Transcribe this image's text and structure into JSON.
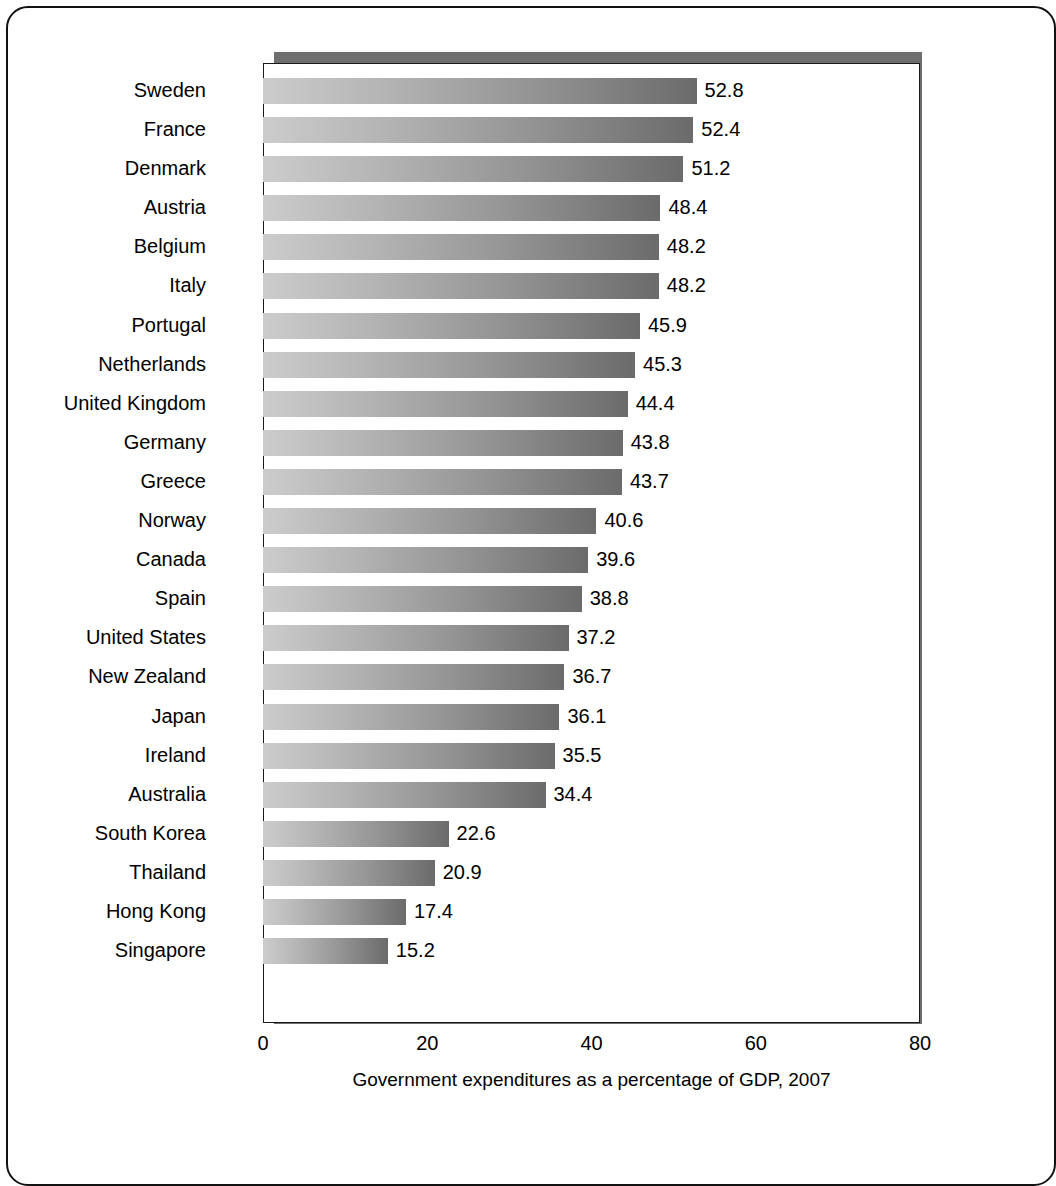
{
  "chart_data": {
    "type": "bar",
    "orientation": "horizontal",
    "title": "",
    "subtitle": "",
    "xlabel": "Government expenditures as a percentage of GDP, 2007",
    "ylabel": "",
    "xlim": [
      0,
      80
    ],
    "xticks": [
      "0",
      "20",
      "40",
      "60",
      "80"
    ],
    "grid": false,
    "legend": null,
    "categories": [
      "Sweden",
      "France",
      "Denmark",
      "Austria",
      "Belgium",
      "Italy",
      "Portugal",
      "Netherlands",
      "United Kingdom",
      "Germany",
      "Greece",
      "Norway",
      "Canada",
      "Spain",
      "United States",
      "New Zealand",
      "Japan",
      "Ireland",
      "Australia",
      "South Korea",
      "Thailand",
      "Hong Kong",
      "Singapore"
    ],
    "values": [
      52.8,
      52.4,
      51.2,
      48.4,
      48.2,
      48.2,
      45.9,
      45.3,
      44.4,
      43.8,
      43.7,
      40.6,
      39.6,
      38.8,
      37.2,
      36.7,
      36.1,
      35.5,
      34.4,
      22.6,
      20.9,
      17.4,
      15.2
    ],
    "value_labels": [
      "52.8",
      "52.4",
      "51.2",
      "48.4",
      "48.2",
      "48.2",
      "45.9",
      "45.3",
      "44.4",
      "43.8",
      "43.7",
      "40.6",
      "39.6",
      "38.8",
      "37.2",
      "36.7",
      "36.1",
      "35.5",
      "34.4",
      "22.6",
      "20.9",
      "17.4",
      "15.2"
    ]
  },
  "style": {
    "bar_gradient_start": "#cccccc",
    "bar_gradient_end": "#6b6b6b",
    "plot_shadow_color": "#6e6e6e",
    "plot_border_color": "#1a1a1a",
    "page_border_color": "#111111",
    "background": "#ffffff",
    "text_color": "#000000"
  }
}
